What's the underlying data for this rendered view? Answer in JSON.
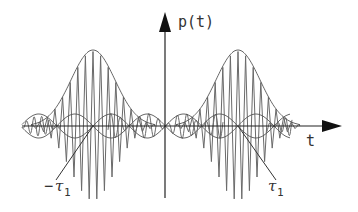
{
  "diagram": {
    "title": "",
    "y_axis_label": "p(t)",
    "x_axis_label": "t",
    "markers": [
      {
        "id": "neg-tau1",
        "symbol": "τ",
        "prefix": "−",
        "subscript": "1"
      },
      {
        "id": "pos-tau1",
        "symbol": "τ",
        "prefix": "",
        "subscript": "1"
      }
    ],
    "colors": {
      "axis": "#222222",
      "envelope": "#555555",
      "carrier": "#6a6a6a",
      "background": "#ffffff"
    }
  }
}
